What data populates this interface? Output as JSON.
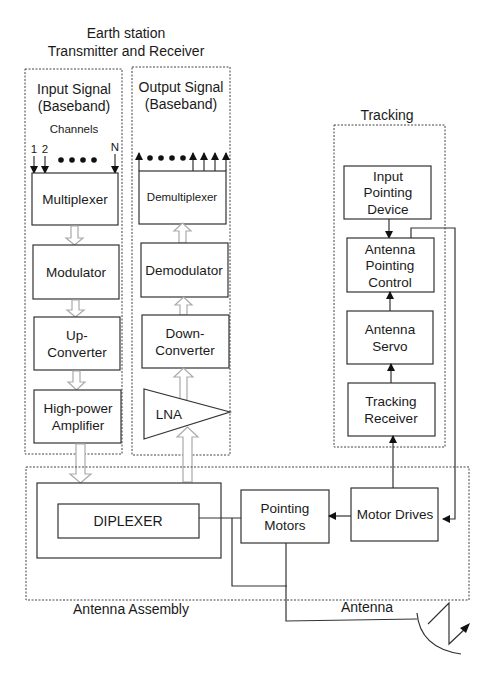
{
  "diagram": {
    "title_line1": "Earth station",
    "title_line2": "Transmitter and Receiver",
    "input_panel": {
      "heading_line1": "Input Signal",
      "heading_line2": "(Baseband)",
      "channels_label": "Channels",
      "channel_1": "1",
      "channel_2": "2",
      "channel_n": "N",
      "blocks": [
        {
          "line1": "Multiplexer",
          "line2": ""
        },
        {
          "line1": "Modulator",
          "line2": ""
        },
        {
          "line1": "Up-",
          "line2": "Converter"
        },
        {
          "line1": "High-power",
          "line2": "Amplifier"
        }
      ]
    },
    "output_panel": {
      "heading_line1": "Output Signal",
      "heading_line2": "(Baseband)",
      "blocks": [
        {
          "line1": "Demultiplexer",
          "line2": ""
        },
        {
          "line1": "Demodulator",
          "line2": ""
        },
        {
          "line1": "Down-",
          "line2": "Converter"
        },
        {
          "line1": "LNA",
          "line2": ""
        }
      ]
    },
    "tracking_panel": {
      "heading": "Tracking",
      "blocks": [
        {
          "line1": "Input",
          "line2": "Pointing",
          "line3": "Device"
        },
        {
          "line1": "Antenna",
          "line2": "Pointing",
          "line3": "Control"
        },
        {
          "line1": "Antenna",
          "line2": "Servo"
        },
        {
          "line1": "Tracking",
          "line2": "Receiver"
        }
      ]
    },
    "antenna_assembly": {
      "label": "Antenna Assembly",
      "diplexer": "DIPLEXER",
      "pointing_motors_line1": "Pointing",
      "pointing_motors_line2": "Motors",
      "motor_drives": "Motor Drives",
      "antenna_label": "Antenna"
    }
  }
}
